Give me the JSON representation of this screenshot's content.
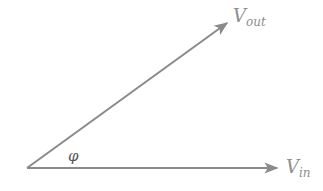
{
  "diagram": {
    "type": "phasor-diagram",
    "colors": {
      "line": "#8a8a8a",
      "text": "#8e8e8e",
      "background": "#ffffff"
    },
    "origin": {
      "x": 27,
      "y": 168
    },
    "vectors": [
      {
        "id": "vout",
        "main": "V",
        "subscript": "out",
        "end": {
          "x": 229,
          "y": 22
        }
      },
      {
        "id": "vin",
        "main": "V",
        "subscript": "in",
        "end": {
          "x": 279,
          "y": 168
        }
      }
    ],
    "angle": {
      "label": "φ"
    }
  }
}
